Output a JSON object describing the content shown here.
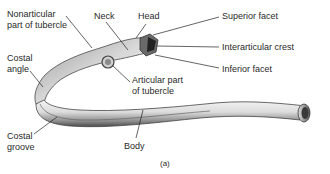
{
  "figure": {
    "caption": "(a)",
    "labels": {
      "nonarticular_tubercle": [
        "Nonarticular",
        "part of tubercle"
      ],
      "neck": "Neck",
      "head": "Head",
      "superior_facet": "Superior facet",
      "interarticular_crest": "Interarticular crest",
      "inferior_facet": "Inferior facet",
      "costal_angle": [
        "Costal",
        "angle"
      ],
      "articular_tubercle": [
        "Articular part",
        "of tubercle"
      ],
      "costal_groove": [
        "Costal",
        "groove"
      ],
      "body": "Body"
    },
    "colors": {
      "background": "#ffffff",
      "text": "#2a2a2a",
      "leader_line": "#222222",
      "bone_light": "#f2f2f2",
      "bone_mid": "#b8b8b8",
      "bone_dark": "#555555"
    }
  }
}
